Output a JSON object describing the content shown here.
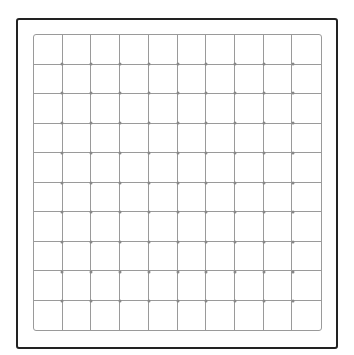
{
  "grid": {
    "rows": 10,
    "columns": 10,
    "line_color": "#9a9a9a",
    "frame_color": "#222222",
    "background": "#ffffff"
  }
}
